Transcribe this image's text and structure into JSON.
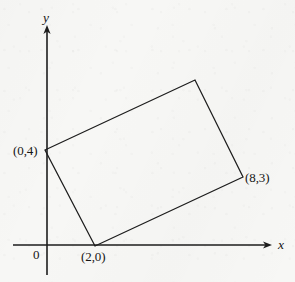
{
  "figure": {
    "background_color": "#f7f7f5",
    "stroke_color": "#1a1a1a"
  },
  "axes": {
    "x_label": "x",
    "y_label": "y",
    "origin_label": "0",
    "x_axis": {
      "x_start": 13,
      "x_end": 272,
      "y": 245,
      "arrow": "right"
    },
    "y_axis": {
      "x": 47,
      "y_start": 26,
      "y_end": 275,
      "arrow": "up"
    }
  },
  "labels": {
    "vertex_left": "(0,4)",
    "vertex_bottom": "(2,0)",
    "vertex_right": "(8,3)"
  },
  "chart_data": {
    "type": "scatter",
    "xlabel": "x",
    "ylabel": "y",
    "grid": false,
    "legend": "none",
    "annotations": [
      "(0,4)",
      "(2,0)",
      "(8,3)",
      "0",
      "x",
      "y"
    ],
    "shapes": [
      {
        "name": "rectangle",
        "type": "polygon",
        "closed": true,
        "fill": "none",
        "stroke": "#1a1a1a",
        "labeled_vertices": [
          {
            "label": "(0,4)",
            "data_x": 0,
            "data_y": 4,
            "px": 45,
            "py": 150
          },
          {
            "label": "",
            "data_x": 6,
            "data_y": 7,
            "px": 195,
            "py": 80
          },
          {
            "label": "(8,3)",
            "data_x": 8,
            "data_y": 3,
            "px": 243,
            "py": 177
          },
          {
            "label": "(2,0)",
            "data_x": 2,
            "data_y": 0,
            "px": 95,
            "py": 246
          }
        ]
      }
    ],
    "points": [
      {
        "label": "(0,4)",
        "x": 0,
        "y": 4
      },
      {
        "label": "(2,0)",
        "x": 2,
        "y": 0
      },
      {
        "label": "(8,3)",
        "x": 8,
        "y": 3
      }
    ]
  }
}
